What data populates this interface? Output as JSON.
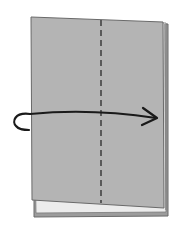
{
  "diagram": {
    "type": "origami-fold-step",
    "colors": {
      "background": "#ffffff",
      "paper": "#b4b4b4",
      "paper_edge": "#6a6a6a",
      "under_layer": "#9c9c9c",
      "gap": "#e8e8e8",
      "fold_line": "#444444",
      "arrow": "#1a1a1a"
    },
    "elements": {
      "paper": "rectangular sheet",
      "fold_line": "vertical dashed valley fold at center",
      "arrow": "curved arrow from left edge pointing right"
    }
  }
}
